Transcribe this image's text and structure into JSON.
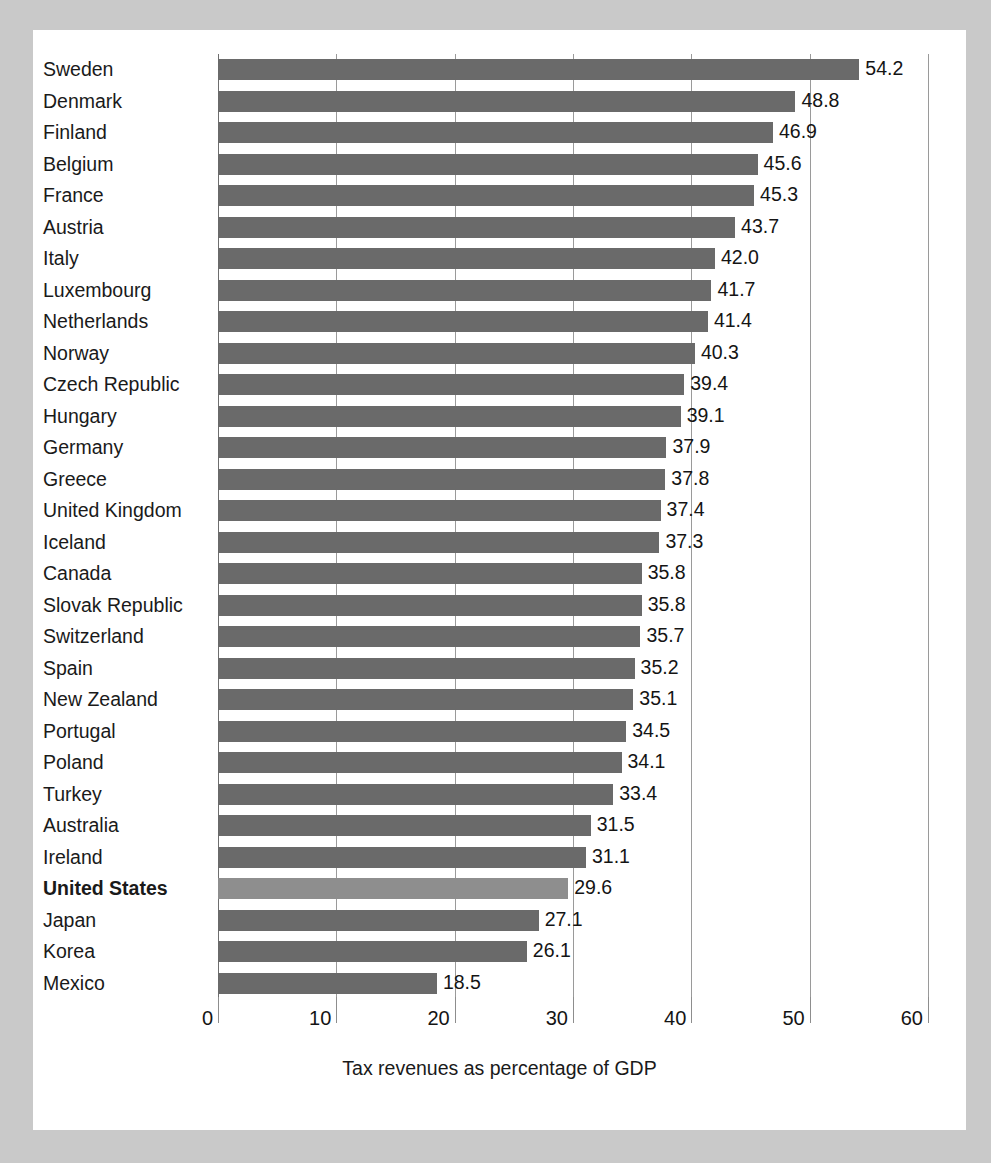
{
  "figure": {
    "background_color": "#c9c9c9",
    "panel_color": "#ffffff",
    "bar_color": "#6a6a6a",
    "highlight_bar_color": "#8e8e8e",
    "grid_color": "#9a9a9a"
  },
  "chart_data": {
    "type": "bar",
    "orientation": "horizontal",
    "title": "",
    "subtitle": "",
    "xlabel": "Tax revenues as percentage of GDP",
    "ylabel": "",
    "xlim": [
      0,
      60
    ],
    "xticks": [
      0,
      10,
      20,
      30,
      40,
      50,
      60
    ],
    "xtick_labels": [
      "0",
      "10",
      "20",
      "30",
      "40",
      "50",
      "60"
    ],
    "grid": true,
    "grid_axis": "x",
    "legend": false,
    "legend_position": "none",
    "highlight_category": "United States",
    "value_format": "one-decimal",
    "categories": [
      "Sweden",
      "Denmark",
      "Finland",
      "Belgium",
      "France",
      "Austria",
      "Italy",
      "Luxembourg",
      "Netherlands",
      "Norway",
      "Czech Republic",
      "Hungary",
      "Germany",
      "Greece",
      "United Kingdom",
      "Iceland",
      "Canada",
      "Slovak Republic",
      "Switzerland",
      "Spain",
      "New Zealand",
      "Portugal",
      "Poland",
      "Turkey",
      "Australia",
      "Ireland",
      "United States",
      "Japan",
      "Korea",
      "Mexico"
    ],
    "values": [
      54.2,
      48.8,
      46.9,
      45.6,
      45.3,
      43.7,
      42.0,
      41.7,
      41.4,
      40.3,
      39.4,
      39.1,
      37.9,
      37.8,
      37.4,
      37.3,
      35.8,
      35.8,
      35.7,
      35.2,
      35.1,
      34.5,
      34.1,
      33.4,
      31.5,
      31.1,
      29.6,
      27.1,
      26.1,
      18.5
    ],
    "value_labels": [
      "54.2",
      "48.8",
      "46.9",
      "45.6",
      "45.3",
      "43.7",
      "42.0",
      "41.7",
      "41.4",
      "40.3",
      "39.4",
      "39.1",
      "37.9",
      "37.8",
      "37.4",
      "37.3",
      "35.8",
      "35.8",
      "35.7",
      "35.2",
      "35.1",
      "34.5",
      "34.1",
      "33.4",
      "31.5",
      "31.1",
      "29.6",
      "27.1",
      "26.1",
      "18.5"
    ]
  }
}
